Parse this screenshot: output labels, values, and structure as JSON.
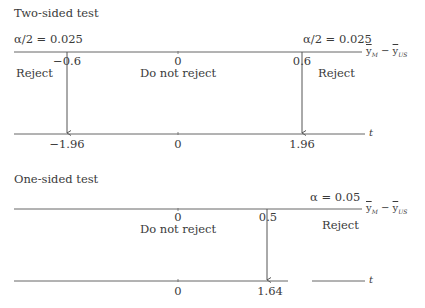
{
  "two_sided": {
    "title": "Two-sided test",
    "alpha_left": "α/2 = 0.025",
    "alpha_right": "α/2 = 0.025",
    "top_axis": {
      "label": "ȳM − ȳUS",
      "label_main1": "y",
      "label_sub1": "M",
      "label_minus": "−",
      "label_main2": "y",
      "label_sub2": "US",
      "ticks": [
        "−0.6",
        "0",
        "0.6"
      ]
    },
    "regions": {
      "left": "Reject",
      "middle": "Do not reject",
      "right": "Reject"
    },
    "bottom_axis": {
      "label": "t",
      "ticks": [
        "−1.96",
        "0",
        "1.96"
      ]
    }
  },
  "one_sided": {
    "title": "One-sided test",
    "alpha_right": "α = 0.05",
    "top_axis": {
      "label": "ȳM − ȳUS",
      "label_main1": "y",
      "label_sub1": "M",
      "label_minus": "−",
      "label_main2": "y",
      "label_sub2": "US",
      "ticks": [
        "0",
        "0.5"
      ]
    },
    "regions": {
      "middle": "Do not reject",
      "right": "Reject"
    },
    "bottom_axis": {
      "label": "t",
      "ticks": [
        "0",
        "1.64"
      ]
    }
  },
  "colors": {
    "line": "#555555",
    "text": "#3a3a3a"
  }
}
